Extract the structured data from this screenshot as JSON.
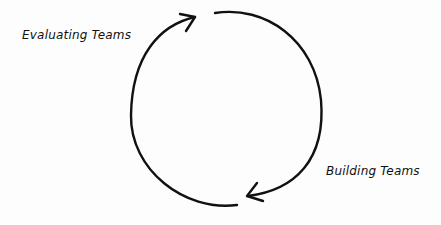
{
  "diagram": {
    "type": "cycle",
    "labels": {
      "top_left": "Evaluating Teams",
      "bottom_right": "Building Teams"
    },
    "stroke_color": "#111111",
    "background": "#fdfdfd"
  }
}
